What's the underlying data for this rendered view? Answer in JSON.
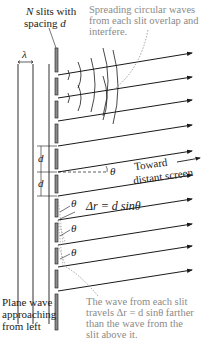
{
  "labels": {
    "n_slits_line1_var": "N",
    "n_slits_line1_rest": " slits with",
    "n_slits_line2_rest": "spacing ",
    "n_slits_line2_var": "d",
    "spreading_line1": "Spreading circular waves",
    "spreading_line2": "from each slit overlap and",
    "spreading_line3": "interfere.",
    "lambda": "λ",
    "d_upper": "d",
    "d_lower": "d",
    "theta_ref": "θ",
    "toward_line1": "Toward",
    "toward_line2": "distant screen",
    "path_diff": "Δr = d sinθ",
    "theta_1": "θ",
    "theta_2": "θ",
    "theta_3": "θ",
    "plane_line1": "Plane wave",
    "plane_line2": "approaching",
    "plane_line3": "from left",
    "travels_line1": "The wave from each slit",
    "travels_line2": "travels Δr = d sinθ farther",
    "travels_line3": "than the wave from the",
    "travels_line4": "slit above it."
  },
  "colors": {
    "line": "#1a1a1a",
    "slit_fill": "#8c8c8c",
    "annotation": "#8a8a8a"
  },
  "geometry": {
    "ray_start_y": [
      75,
      98,
      121,
      146,
      172,
      196,
      220,
      245,
      267,
      291
    ]
  }
}
